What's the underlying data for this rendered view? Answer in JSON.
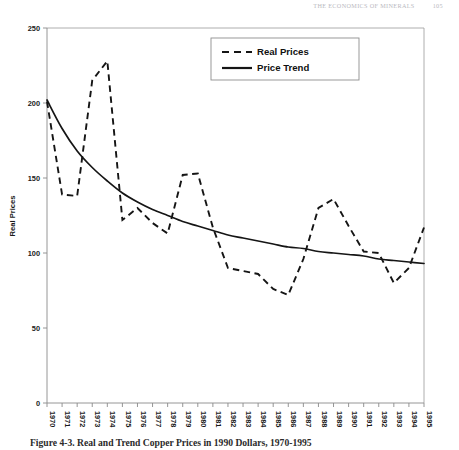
{
  "running_head": {
    "title": "THE ECONOMICS OF MINERALS",
    "page_number": "105"
  },
  "figure": {
    "caption": "Figure 4-3. Real and Trend Copper Prices in 1990 Dollars, 1970-1995"
  },
  "legend": {
    "position": "top-center",
    "entries": [
      {
        "label": "Real Prices",
        "style": "dashed"
      },
      {
        "label": "Price Trend",
        "style": "solid"
      }
    ]
  },
  "chart_data": {
    "type": "line",
    "title": "",
    "xlabel": "",
    "ylabel": "Real Prices",
    "xlim": [
      1970,
      1995
    ],
    "ylim": [
      0,
      250
    ],
    "yticks": [
      0,
      50,
      100,
      150,
      200,
      250
    ],
    "ytick_labels": [
      "0",
      "50",
      "100",
      "150",
      "200",
      "250"
    ],
    "grid": false,
    "legend_position": "top-center",
    "x": [
      1970,
      1971,
      1972,
      1973,
      1974,
      1975,
      1976,
      1977,
      1978,
      1979,
      1980,
      1981,
      1982,
      1983,
      1984,
      1985,
      1986,
      1987,
      1988,
      1989,
      1990,
      1991,
      1992,
      1993,
      1994,
      1995
    ],
    "xtick_labels": [
      "1970",
      "1971",
      "1972",
      "1973",
      "1974",
      "1975",
      "1976",
      "1977",
      "1978",
      "1979",
      "1980",
      "1981",
      "1982",
      "1983",
      "1984",
      "1985",
      "1986",
      "1987",
      "1988",
      "1989",
      "1990",
      "1991",
      "1992",
      "1993",
      "1994",
      "1995"
    ],
    "series": [
      {
        "name": "Real Prices",
        "style": "dashed",
        "color": "#151515",
        "values": [
          201,
          139,
          138,
          215,
          228,
          122,
          130,
          120,
          113,
          152,
          153,
          117,
          90,
          88,
          86,
          76,
          72,
          96,
          130,
          136,
          118,
          101,
          100,
          80,
          90,
          117
        ]
      },
      {
        "name": "Price Trend",
        "style": "solid",
        "color": "#151515",
        "values": [
          202,
          183,
          168,
          157,
          148,
          140,
          134,
          129,
          125,
          121,
          118,
          115,
          112,
          110,
          108,
          106,
          104,
          103,
          101,
          100,
          99,
          98,
          96,
          95,
          94,
          93
        ]
      }
    ]
  }
}
